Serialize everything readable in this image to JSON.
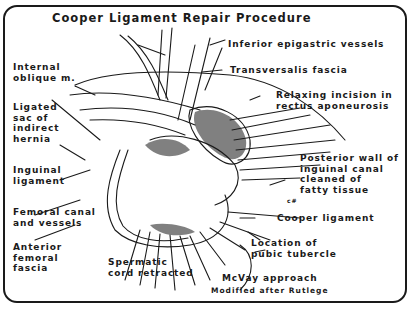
{
  "title": "Cooper Ligament Repair Procedure",
  "labels": {
    "inferior_epigastric": "Inferior epigastric vessels",
    "transversalis": "Transversalis fascia",
    "relaxing_incision": "Relaxing incision in\nrectus aponeurosis",
    "internal_oblique": "Internal\noblique m.",
    "ligated_sac": "Ligated\nsac of\nindirect\nhernia",
    "inguinal_ligament": "Inguinal\nligament",
    "posterior_wall": "Posterior wall of\ninguinal canal\ncleaned of\nfatty tissue",
    "femoral_canal": "Femoral canal\nand vessels",
    "cooper_ligament": "Cooper ligament",
    "anterior_femoral": "Anterior\nfemoral\nfascia",
    "pubic_tubercle": "Location of\npubic tubercle",
    "spermatic_cord": "Spermatic\ncord retracted",
    "approach": "McVay approach",
    "credit": "Modified after Rutlege",
    "artist_initials": "c#"
  },
  "colors": {
    "ink": "#1a1a1a",
    "background": "#ffffff"
  }
}
